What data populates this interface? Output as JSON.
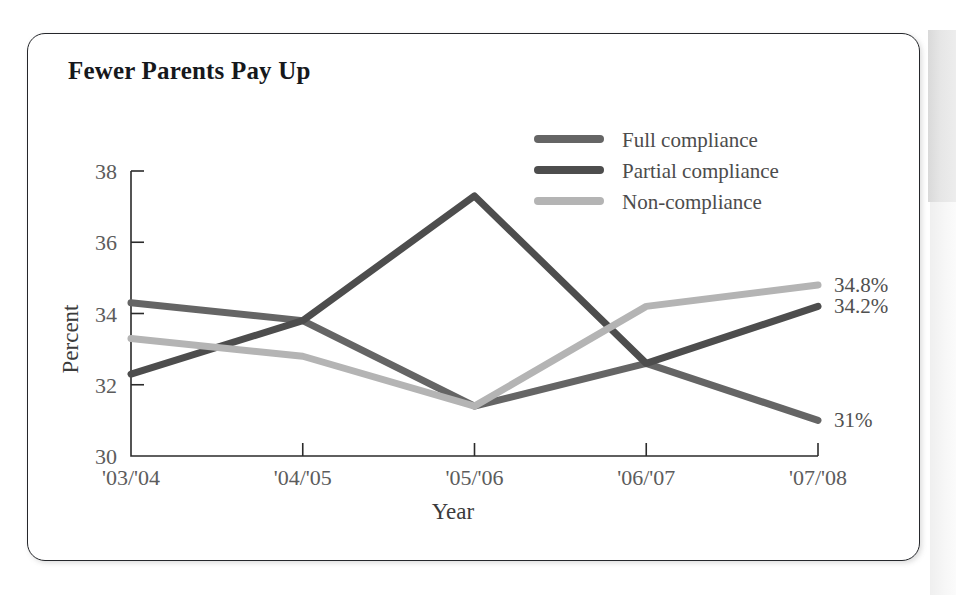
{
  "page": {
    "background_color": "#ffffff",
    "edge_strip_color": "#e2e2e2"
  },
  "card": {
    "border_color": "#25272b",
    "background_color": "#ffffff"
  },
  "chart_data": {
    "type": "line",
    "title": "Fewer Parents Pay Up",
    "xlabel": "Year",
    "ylabel": "Percent",
    "categories": [
      "'03/'04",
      "'04/'05",
      "'05/'06",
      "'06/'07",
      "'07/'08"
    ],
    "ylim": [
      30,
      38
    ],
    "yticks": [
      30,
      32,
      34,
      36,
      38
    ],
    "ytick_labels": [
      "30",
      "32",
      "34",
      "36",
      "38"
    ],
    "grid": false,
    "legend_position": "top-right",
    "series": [
      {
        "name": "Full compliance",
        "color": "#656565",
        "values": [
          34.3,
          33.8,
          31.4,
          32.6,
          31.0
        ],
        "end_label": "31%"
      },
      {
        "name": "Partial compliance",
        "color": "#4d4d4d",
        "values": [
          32.3,
          33.8,
          37.3,
          32.6,
          34.2
        ],
        "end_label": "34.2%"
      },
      {
        "name": "Non-compliance",
        "color": "#b4b4b4",
        "values": [
          33.3,
          32.8,
          31.4,
          34.2,
          34.8
        ],
        "end_label": "34.8%"
      }
    ]
  }
}
